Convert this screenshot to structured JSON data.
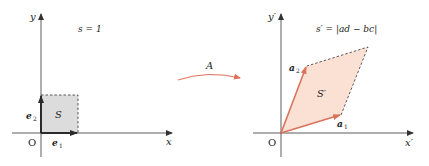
{
  "left": {
    "formula": "s = 1",
    "x_label": "x",
    "y_label": "y",
    "origin_label": "O",
    "area_label": "S",
    "vec1_label": "e",
    "vec1_sub": "1",
    "vec2_label": "e",
    "vec2_sub": "2"
  },
  "transform": {
    "label": "A"
  },
  "right": {
    "formula": "s′ = |ad − bc|",
    "x_label": "x′",
    "y_label": "y′",
    "origin_label": "O",
    "area_label": "S′",
    "vec1_label": "a",
    "vec1_sub": "1",
    "vec2_label": "a",
    "vec2_sub": "2"
  },
  "colors": {
    "axis": "#333333",
    "square_fill": "#dcdcdc",
    "basis_vector": "#2b2b2b",
    "parallelogram_fill": "#fbe0d4",
    "image_vector": "#d9735a",
    "transform_arrow": "#e0705a"
  }
}
